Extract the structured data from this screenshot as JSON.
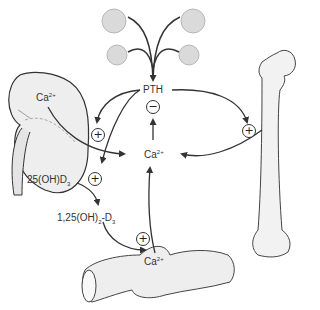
{
  "diagram": {
    "nodes": {
      "pth": {
        "label": "PTH"
      },
      "ca_center": {
        "label": "Ca",
        "superscript": "2+"
      },
      "ca_kidney": {
        "label": "Ca",
        "superscript": "2+"
      },
      "ca_intestine": {
        "label": "Ca",
        "superscript": "2+"
      },
      "vitd_25": {
        "label": "25(OH)D",
        "subscript": "3"
      },
      "vitd_125_prefix": {
        "label": "1,25(OH)"
      },
      "vitd_125_sub": {
        "label": "2"
      },
      "vitd_125_suffix": {
        "label": "-D"
      },
      "vitd_125_sub2": {
        "label": "3"
      }
    },
    "signs": {
      "negative_feedback": "−",
      "kidney_plus": "+",
      "vitd_plus": "+",
      "bone_plus": "+",
      "intestine_plus": "+"
    },
    "organs": [
      "parathyroid-glands",
      "kidney",
      "femur-bone",
      "intestine"
    ],
    "colors": {
      "line": "#333333",
      "fill": "#e6e6e6",
      "gland": "#d9d9d9"
    }
  }
}
